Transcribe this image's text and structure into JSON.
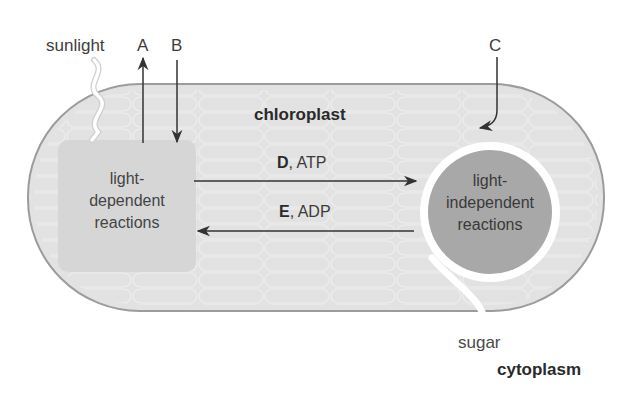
{
  "diagram": {
    "type": "photosynthesis-overview",
    "colors": {
      "chloroplast_fill": "#e3e3e3",
      "chloroplast_border": "#9a9a9a",
      "light_dependent_fill": "#d9d9d9",
      "light_independent_fill": "#a9a9a9",
      "ring": "#ffffff",
      "arrow": "#333333",
      "text": "#3a3a3a"
    },
    "labels": {
      "sunlight": "sunlight",
      "A": "A",
      "B": "B",
      "C": "C",
      "chloroplast": "chloroplast",
      "cytoplasm": "cytoplasm",
      "sugar": "sugar"
    },
    "nodes": {
      "light_dependent": {
        "line1": "light-",
        "line2": "dependent",
        "line3": "reactions"
      },
      "light_independent": {
        "line1": "light-",
        "line2": "independent",
        "line3": "reactions"
      }
    },
    "edges": {
      "forward": {
        "letter": "D",
        "rest": ", ATP"
      },
      "backward": {
        "letter": "E",
        "rest": ", ADP"
      }
    }
  }
}
